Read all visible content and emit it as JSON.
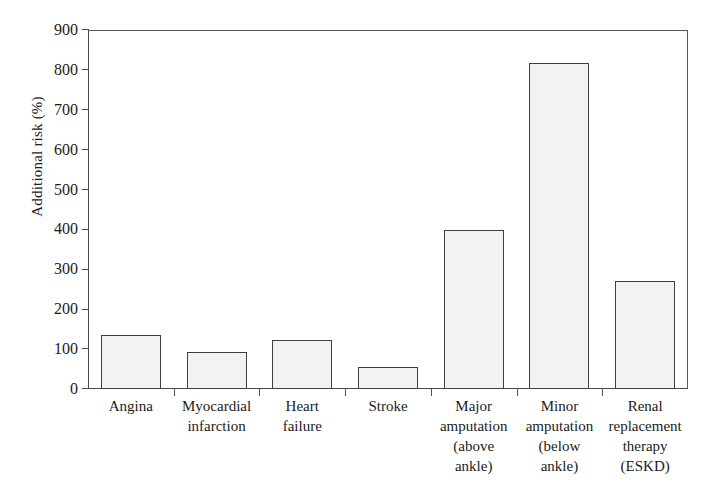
{
  "chart_data": {
    "type": "bar",
    "title": "",
    "subtitle": "",
    "xlabel": "",
    "ylabel": "Additional risk (%)",
    "ylim": [
      0,
      900
    ],
    "ytick_interval": 100,
    "yticks": [
      "0",
      "100",
      "200",
      "300",
      "400",
      "500",
      "600",
      "700",
      "800",
      "900"
    ],
    "grid": false,
    "legend": "none",
    "categories": [
      "Angina",
      "Myocardial infarction",
      "Heart failure",
      "Stroke",
      "Major amputation (above ankle)",
      "Minor amputation (below ankle)",
      "Renal replacement therapy (ESKD)"
    ],
    "category_lines": [
      [
        "Angina"
      ],
      [
        "Myocardial",
        "infarction"
      ],
      [
        "Heart",
        "failure"
      ],
      [
        "Stroke"
      ],
      [
        "Major",
        "amputation",
        "(above",
        "ankle)"
      ],
      [
        "Minor",
        "amputation",
        "(below",
        "ankle)"
      ],
      [
        "Renal",
        "replacement",
        "therapy",
        "(ESKD)"
      ]
    ],
    "values": [
      135,
      93,
      122,
      55,
      398,
      818,
      272
    ],
    "bar_fill_color": "#f2f2f0",
    "bar_edge_color": "#3f3f3f",
    "axis_color": "#4a4a4a",
    "background_color": "#ffffff"
  }
}
